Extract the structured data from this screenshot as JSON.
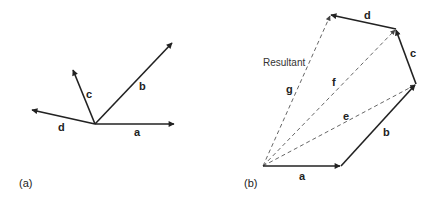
{
  "panel_a": {
    "caption": "(a)",
    "vectors": [
      {
        "name": "a",
        "label": "a"
      },
      {
        "name": "b",
        "label": "b"
      },
      {
        "name": "c",
        "label": "c"
      },
      {
        "name": "d",
        "label": "d"
      }
    ]
  },
  "panel_b": {
    "caption": "(b)",
    "resultant_label": "Resultant",
    "vectors": [
      {
        "name": "a",
        "label": "a",
        "style": "solid"
      },
      {
        "name": "b",
        "label": "b",
        "style": "solid"
      },
      {
        "name": "c",
        "label": "c",
        "style": "solid"
      },
      {
        "name": "d",
        "label": "d",
        "style": "solid"
      },
      {
        "name": "e",
        "label": "e",
        "style": "dashed"
      },
      {
        "name": "f",
        "label": "f",
        "style": "dashed"
      },
      {
        "name": "g",
        "label": "g",
        "style": "dashed"
      }
    ]
  },
  "colors": {
    "line": "#222222",
    "dashed": "#555555",
    "background": "#ffffff"
  }
}
